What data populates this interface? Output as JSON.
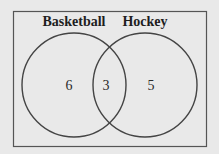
{
  "diagram": {
    "type": "venn",
    "sets": [
      {
        "label": "Basketball",
        "only_count": "6"
      },
      {
        "label": "Hockey",
        "only_count": "5"
      }
    ],
    "intersection_count": "3",
    "colors": {
      "background": "#e9e9e9",
      "stroke": "#444444"
    }
  }
}
